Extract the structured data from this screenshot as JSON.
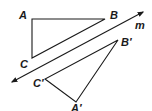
{
  "diagram": {
    "line": {
      "label": "m",
      "from": [
        12,
        82
      ],
      "to": [
        143,
        12
      ],
      "label_pos": [
        135,
        29
      ]
    },
    "triangle_original": {
      "vertices": {
        "A": [
          32,
          19
        ],
        "B": [
          105,
          19
        ],
        "C": [
          32,
          58
        ]
      },
      "labels": {
        "A": "A",
        "B": "B",
        "C": "C"
      }
    },
    "triangle_image": {
      "vertices": {
        "A_prime": [
          76,
          102
        ],
        "B_prime": [
          118,
          40
        ],
        "C_prime": [
          45,
          79
        ]
      },
      "labels": {
        "A_prime": "A′",
        "B_prime": "B′",
        "C_prime": "C′"
      }
    },
    "stroke_color": "#1a1a1a"
  }
}
